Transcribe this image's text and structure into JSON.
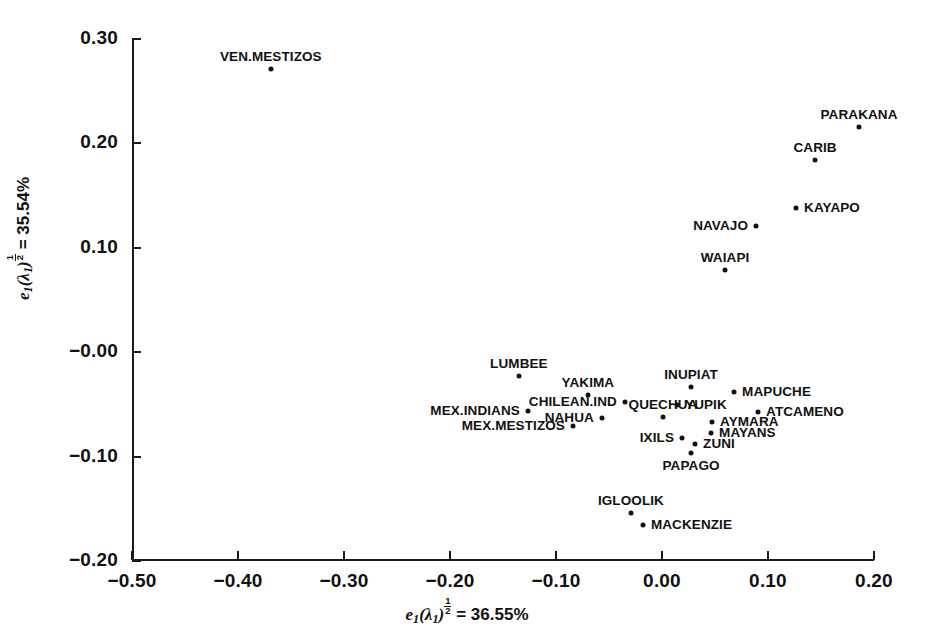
{
  "chart_data": {
    "type": "scatter",
    "title": "",
    "xlabel": "e1(λ1)^(1/2) = 36.55%",
    "ylabel": "e1(λ1)^(1/2) = 35.54%",
    "xlabel_parts": {
      "var": "e",
      "sub": "1",
      "paren": "(λ",
      "paren_sub": "1",
      "close": ")",
      "exp_num": "1",
      "exp_den": "2",
      "eq": "= 36.55%"
    },
    "ylabel_parts": {
      "var": "e",
      "sub": "1",
      "paren": "(λ",
      "paren_sub": "1",
      "close": ")",
      "exp_num": "1",
      "exp_den": "2",
      "eq": "= 35.54%"
    },
    "xlim": [
      -0.5,
      0.2
    ],
    "ylim": [
      -0.2,
      0.3
    ],
    "xticks": [
      -0.5,
      -0.4,
      -0.3,
      -0.2,
      -0.1,
      0.0,
      0.1,
      0.2
    ],
    "yticks": [
      0.3,
      0.2,
      0.1,
      -0.0,
      -0.1,
      -0.2
    ],
    "xticklabels": [
      "−0.50",
      "−0.40",
      "−0.30",
      "−0.20",
      "−0.10",
      "0.00",
      "0.10",
      "0.20"
    ],
    "yticklabels": [
      "0.30",
      "0.20",
      "0.10",
      "−0.00",
      "−0.10",
      "−0.20"
    ],
    "grid": false,
    "legend": "none",
    "marker_color": "#111111",
    "points": [
      {
        "label": "VEN.MESTIZOS",
        "x": -0.369,
        "y": 0.271,
        "pos": "above"
      },
      {
        "label": "PARAKANA",
        "x": 0.1859,
        "y": 0.2155,
        "pos": "above"
      },
      {
        "label": "CARIB",
        "x": 0.1444,
        "y": 0.1839,
        "pos": "above"
      },
      {
        "label": "KAYAPO",
        "x": 0.1265,
        "y": 0.1384,
        "pos": "right"
      },
      {
        "label": "NAVAJO",
        "x": 0.0887,
        "y": 0.1211,
        "pos": "left"
      },
      {
        "label": "WAIAPI",
        "x": 0.0595,
        "y": 0.0789,
        "pos": "above"
      },
      {
        "label": "LUMBEE",
        "x": -0.135,
        "y": -0.023,
        "pos": "above"
      },
      {
        "label": "INUPIAT",
        "x": 0.0274,
        "y": -0.0335,
        "pos": "above"
      },
      {
        "label": "MAPUCHE",
        "x": 0.068,
        "y": -0.0383,
        "pos": "right"
      },
      {
        "label": "YAKIMA",
        "x": -0.0699,
        "y": -0.0412,
        "pos": "above"
      },
      {
        "label": "CHILEAN.IND",
        "x": -0.035,
        "y": -0.0478,
        "pos": "left"
      },
      {
        "label": "YUPIK",
        "x": 0.0142,
        "y": -0.0507,
        "pos": "right"
      },
      {
        "label": "ATCAMENO",
        "x": 0.0906,
        "y": -0.0574,
        "pos": "right"
      },
      {
        "label": "MEX.INDIANS",
        "x": -0.1265,
        "y": -0.0565,
        "pos": "left"
      },
      {
        "label": "QUECHUA",
        "x": 0.001,
        "y": -0.0622,
        "pos": "above"
      },
      {
        "label": "NAHUA",
        "x": -0.0567,
        "y": -0.0632,
        "pos": "left"
      },
      {
        "label": "AYMARA",
        "x": 0.0472,
        "y": -0.067,
        "pos": "right"
      },
      {
        "label": "MEX.MESTIZOS",
        "x": -0.084,
        "y": -0.0707,
        "pos": "left"
      },
      {
        "label": "MAYANS",
        "x": 0.0463,
        "y": -0.0775,
        "pos": "right"
      },
      {
        "label": "IXILS",
        "x": 0.0189,
        "y": -0.0822,
        "pos": "left"
      },
      {
        "label": "ZUNI",
        "x": 0.0312,
        "y": -0.088,
        "pos": "right"
      },
      {
        "label": "PAPAGO",
        "x": 0.0274,
        "y": -0.0965,
        "pos": "below"
      },
      {
        "label": "IGLOOLIK",
        "x": -0.0293,
        "y": -0.1538,
        "pos": "above"
      },
      {
        "label": "MACKENZIE",
        "x": -0.018,
        "y": -0.1653,
        "pos": "right"
      }
    ]
  }
}
